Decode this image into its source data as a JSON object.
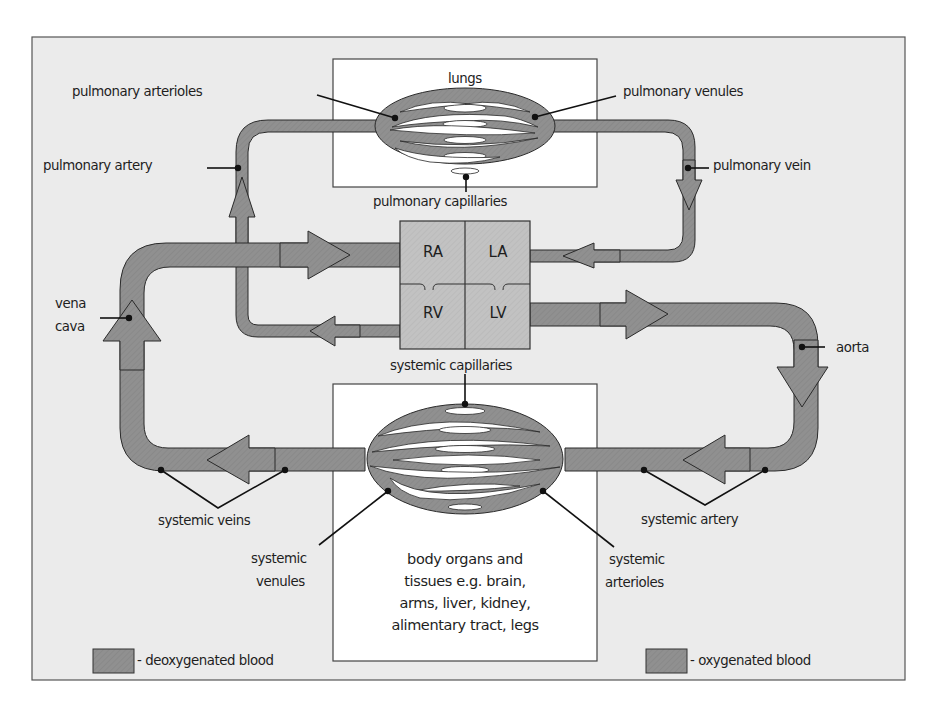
{
  "diagram": {
    "type": "circulatory-system",
    "colors": {
      "background": "#ffffff",
      "frame_fill": "#ebebeb",
      "frame_stroke": "#555555",
      "box_fill": "#ffffff",
      "vessel_fill": "#8f8f8f",
      "heart_fill": "#bdbdbd",
      "outline": "#2a2a2a"
    },
    "compartments": {
      "lungs": "lungs",
      "body": [
        "body organs and",
        "tissues e.g. brain,",
        "arms, liver, kidney,",
        "alimentary tract, legs"
      ]
    },
    "heart": {
      "chambers": [
        "RA",
        "LA",
        "RV",
        "LV"
      ]
    },
    "labels": {
      "pulmonary_arterioles": "pulmonary arterioles",
      "pulmonary_venules": "pulmonary venules",
      "pulmonary_artery": "pulmonary artery",
      "pulmonary_vein": "pulmonary vein",
      "pulmonary_capillaries": "pulmonary capillaries",
      "vena_cava_1": "vena",
      "vena_cava_2": "cava",
      "aorta": "aorta",
      "systemic_capillaries": "systemic capillaries",
      "systemic_veins": "systemic veins",
      "systemic_artery": "systemic artery",
      "systemic_venules_1": "systemic",
      "systemic_venules_2": "venules",
      "systemic_arterioles_1": "systemic",
      "systemic_arterioles_2": "arterioles"
    },
    "legend": [
      {
        "swatch": "#8a8a8a",
        "label": "- deoxygenated blood"
      },
      {
        "swatch": "#8f8f8f",
        "label": "- oxygenated blood"
      }
    ]
  }
}
